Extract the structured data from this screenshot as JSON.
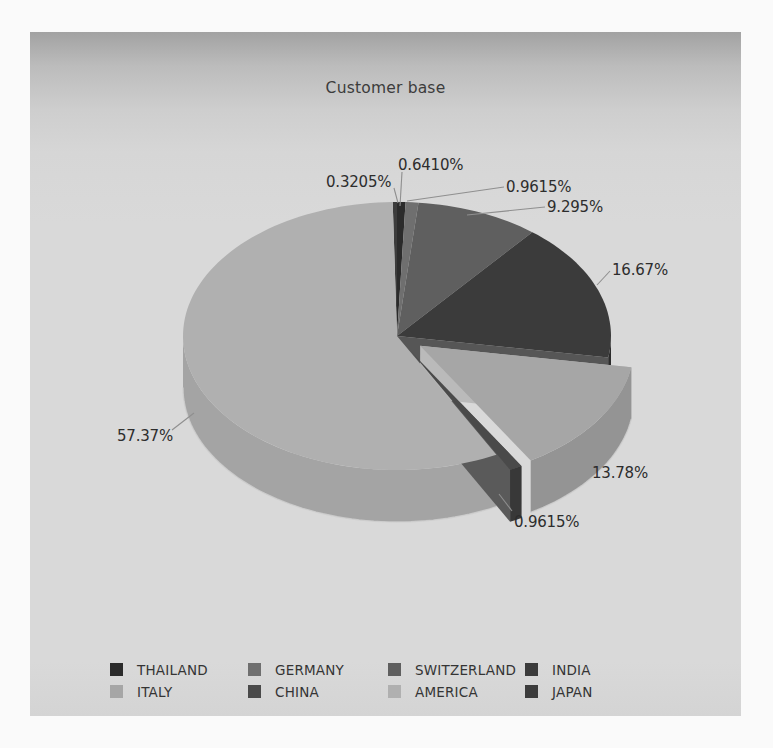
{
  "chart_data": {
    "type": "pie",
    "title": "Customer base",
    "is_3d": true,
    "exploded": true,
    "start_angle_deg": 90,
    "direction": "clockwise",
    "legend_position": "bottom",
    "units": "percent",
    "slices": [
      {
        "name": "THAILAND",
        "value": 0.641,
        "label": "0.6410%",
        "color": "#2b2b2b",
        "side": "#222222",
        "edge": "#3a3a3a",
        "exploded": false
      },
      {
        "name": "GERMANY",
        "value": 0.9615,
        "label": "0.9615%",
        "color": "#6f6f6f",
        "side": "#5c5c5c",
        "edge": "#7a7a7a",
        "exploded": false
      },
      {
        "name": "SWITZERLAND",
        "value": 9.295,
        "label": "9.295%",
        "color": "#5f5f5f",
        "side": "#4c4c4c",
        "edge": "#6a6a6a",
        "exploded": false
      },
      {
        "name": "INDIA",
        "value": 16.67,
        "label": "16.67%",
        "color": "#3b3b3b",
        "side": "#2c2c2c",
        "edge": "#565656",
        "exploded": false
      },
      {
        "name": "ITALY",
        "value": 13.78,
        "label": "13.78%",
        "color": "#a6a6a6",
        "side": "#949494",
        "edge": "#bababa",
        "exploded": true
      },
      {
        "name": "CHINA",
        "value": 0.9615,
        "label": "0.9615%",
        "color": "#4a4a4a",
        "side": "#383838",
        "edge": "#5a5a5a",
        "exploded": true
      },
      {
        "name": "AMERICA",
        "value": 57.37,
        "label": "57.37%",
        "color": "#b0b0b0",
        "side": "#a4a4a4",
        "edge": "#c3c3c3",
        "exploded": false
      },
      {
        "name": "JAPAN",
        "value": 0.3205,
        "label": "0.3205%",
        "color": "#3c3c3c",
        "side": "#2e2e2e",
        "edge": "#4a4a4a",
        "exploded": false
      }
    ]
  },
  "legend": {
    "items": [
      {
        "name": "THAILAND",
        "col": 0,
        "row": 0
      },
      {
        "name": "GERMANY",
        "col": 1,
        "row": 0
      },
      {
        "name": "SWITZERLAND",
        "col": 2,
        "row": 0
      },
      {
        "name": "INDIA",
        "col": 3,
        "row": 0
      },
      {
        "name": "ITALY",
        "col": 0,
        "row": 1
      },
      {
        "name": "CHINA",
        "col": 1,
        "row": 1
      },
      {
        "name": "AMERICA",
        "col": 2,
        "row": 1
      },
      {
        "name": "JAPAN",
        "col": 3,
        "row": 1
      }
    ]
  },
  "layout": {
    "page": {
      "width": 773,
      "height": 748
    },
    "panel": {
      "left": 30,
      "top": 32,
      "width": 711,
      "height": 684
    },
    "pie": {
      "cx": 397,
      "cy": 336,
      "rx": 214,
      "ry": 134,
      "depth": 52,
      "explode": 0.13
    },
    "leader_color": "#8f8f8f",
    "callouts": [
      {
        "x": 398,
        "y": 156,
        "line": [
          402,
          172,
          400,
          206
        ]
      },
      {
        "x": 506,
        "y": 178,
        "line": [
          504,
          187,
          407,
          201
        ]
      },
      {
        "x": 547,
        "y": 198,
        "line": [
          545,
          207,
          467,
          215
        ]
      },
      {
        "x": 612,
        "y": 261,
        "line": [
          610,
          271,
          597,
          285
        ]
      },
      {
        "x": 592,
        "y": 464,
        "line": null
      },
      {
        "x": 514,
        "y": 513,
        "line": [
          512,
          511,
          499,
          494
        ]
      },
      {
        "x": 117,
        "y": 427,
        "line": [
          172,
          430,
          194,
          413
        ]
      },
      {
        "x": 326,
        "y": 173,
        "line": [
          394,
          188,
          398,
          203
        ]
      }
    ],
    "legend_grid": {
      "cols": [
        110,
        248,
        388,
        525
      ],
      "rows": [
        662,
        684
      ]
    }
  }
}
